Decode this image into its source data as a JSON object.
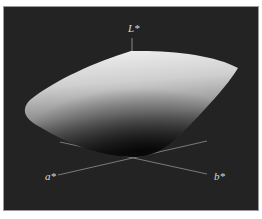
{
  "figure": {
    "axes": {
      "vertical": "L*",
      "left": "a*",
      "right": "b*"
    },
    "colors": {
      "background": "#232323",
      "frame": "#ffffff",
      "surface_light": "#f2f2f2",
      "surface_dark": "#1a1a1a",
      "axis_line": "#8a8a8a",
      "label": "#d8d8d8"
    }
  }
}
